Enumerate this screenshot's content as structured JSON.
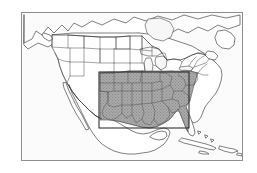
{
  "figure": {
    "kind": "locator-map",
    "background_color": "#ffffff",
    "map_background_color": "#fbfbfb",
    "frame_color": "#8d8d8d",
    "coastline_color": "#4a4a4a",
    "state_boundary_color": "#5a5a5a",
    "study_area_fill_color": "#a8a8a8",
    "study_area_hatch_color": "#8a8a8a",
    "bounding_box_color": "#2b2b2b"
  },
  "map": {
    "frame": {
      "x": 21,
      "y": 12,
      "width": 222,
      "height": 149
    },
    "bounding_box": {
      "x": 98,
      "y": 71,
      "width": 90,
      "height": 56
    },
    "extent_label": "",
    "title": "",
    "legend": [],
    "labels": []
  },
  "chart_data": {
    "type": "map",
    "title": "",
    "region": "North America",
    "shaded_region_name": "South-central and southeastern United States",
    "shaded_states": [
      "Texas",
      "Oklahoma",
      "Kansas",
      "Missouri",
      "Arkansas",
      "Louisiana",
      "Mississippi",
      "Alabama",
      "Tennessee",
      "Kentucky",
      "Georgia",
      "Florida",
      "South Carolina",
      "North Carolina",
      "Virginia",
      "West Virginia",
      "Illinois",
      "Indiana",
      "Ohio"
    ],
    "unshaded_regions": [
      "Western United States",
      "Northern Plains",
      "Northeastern United States",
      "Canada",
      "Mexico",
      "Caribbean"
    ],
    "overlay_box": {
      "label": "study area bounding box",
      "style": "solid black rectangle"
    },
    "grid": false,
    "legend_position": "none"
  }
}
